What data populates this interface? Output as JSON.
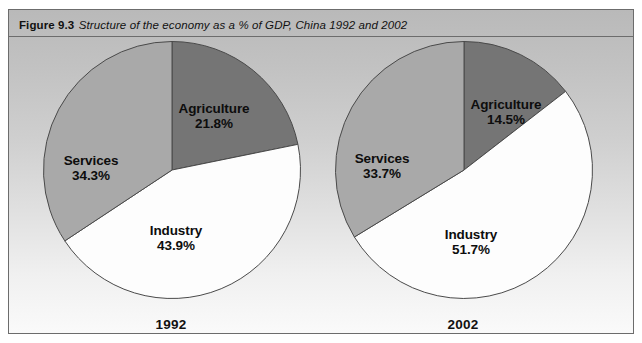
{
  "figure": {
    "number": "Figure 9.3",
    "caption": "Structure of the economy as a % of GDP, China 1992 and 2002"
  },
  "colors": {
    "agriculture": "#757575",
    "industry": "#fdfdfd",
    "services": "#a9a9a9",
    "outline": "#4a4a4a",
    "panel_top": "#b9b9b9",
    "panel_bottom": "#fafafa",
    "border": "#6c6c6c",
    "text": "#111111"
  },
  "chart_data": {
    "type": "pie",
    "title": "Structure of the economy as a % of GDP, China 1992 and 2002",
    "xlabel": "",
    "ylabel": "",
    "legend": "none",
    "grid": false,
    "units": "% of GDP",
    "categories": [
      "Agriculture",
      "Industry",
      "Services"
    ],
    "charts": [
      {
        "name": "1992",
        "year_label": "1992",
        "slices": [
          {
            "label": "Agriculture",
            "value": 21.8,
            "value_text": "21.8%",
            "color": "#757575"
          },
          {
            "label": "Industry",
            "value": 43.9,
            "value_text": "43.9%",
            "color": "#fdfdfd"
          },
          {
            "label": "Services",
            "value": 34.3,
            "value_text": "34.3%",
            "color": "#a9a9a9"
          }
        ]
      },
      {
        "name": "2002",
        "year_label": "2002",
        "slices": [
          {
            "label": "Agriculture",
            "value": 14.5,
            "value_text": "14.5%",
            "color": "#757575"
          },
          {
            "label": "Industry",
            "value": 51.7,
            "value_text": "51.7%",
            "color": "#fdfdfd"
          },
          {
            "label": "Services",
            "value": 33.7,
            "value_text": "33.7%",
            "color": "#a9a9a9"
          }
        ]
      }
    ]
  }
}
